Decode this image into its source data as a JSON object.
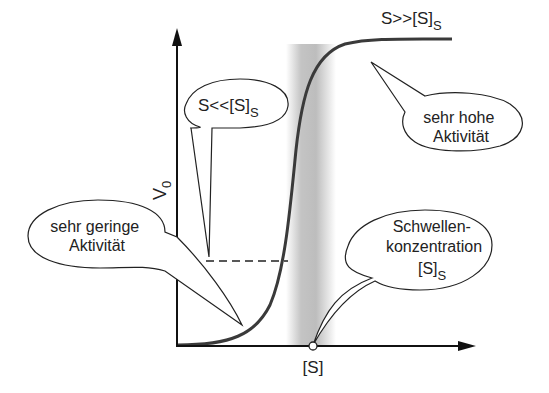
{
  "diagram": {
    "type": "sigmoid-threshold-kinetics",
    "axes": {
      "y_label": "V",
      "y_label_sub": "0",
      "x_label": "[S]"
    },
    "curve_top_label": {
      "main": "S>>[S]",
      "sub": "S"
    },
    "callouts": {
      "low_substrate": {
        "main": "S<<[S]",
        "sub": "S"
      },
      "high_activity": {
        "line1": "sehr hohe",
        "line2": "Aktivität"
      },
      "low_activity": {
        "line1": "sehr geringe",
        "line2": "Aktivität"
      },
      "threshold": {
        "line1": "Schwellen-",
        "line2": "konzentration",
        "line3": "[S]",
        "line3_sub": "S"
      }
    },
    "colors": {
      "line": "#1a1a1a",
      "curve": "#3a3a3a",
      "band": "#b8b8b8"
    }
  }
}
